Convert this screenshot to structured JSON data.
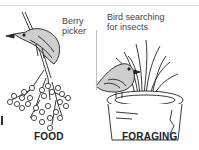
{
  "panels": [
    {
      "caption": "FOOD",
      "annotation_line1": "Berry",
      "annotation_line2": "picker"
    },
    {
      "caption": "FORAGING",
      "annotation_line1": "Bird searching",
      "annotation_line2": "for insects"
    }
  ],
  "colors": {
    "ink": "#222222",
    "label": "#444444",
    "bird_fill": "#c9c9c9",
    "background": "#ffffff"
  }
}
